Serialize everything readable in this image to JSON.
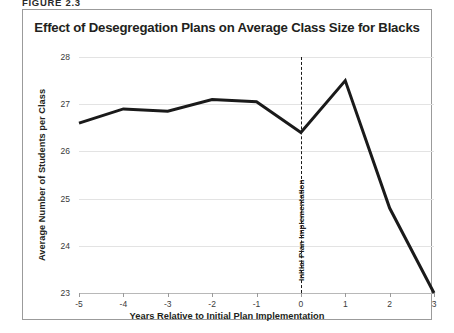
{
  "figure": {
    "label": "FIGURE 2.3"
  },
  "chart": {
    "title": "Effect of Desegregation Plans on Average Class Size for Blacks",
    "border_color": "#9b9b9b",
    "line_color": "#1a1a1a",
    "grid_color": "#e3e3e3",
    "axis_color": "#b8b8b8"
  },
  "annotation": {
    "event_label": "Initial Plan Implementation",
    "event_x": 0
  },
  "chart_data": {
    "type": "line",
    "title": "Effect of Desegregation Plans on Average Class Size for Blacks",
    "xlabel": "Years Relative to Initial Plan Implementation",
    "ylabel": "Average Number of Students per Class",
    "x": [
      -5,
      -4,
      -3,
      -2,
      -1,
      0,
      1,
      2,
      3
    ],
    "xtick_labels": [
      "-5",
      "-4",
      "-3",
      "-2",
      "-1",
      "0",
      "1",
      "2",
      "3"
    ],
    "values": [
      26.6,
      26.9,
      26.85,
      27.1,
      27.05,
      26.4,
      27.5,
      24.8,
      23.0
    ],
    "ytick_labels": [
      "28",
      "27",
      "26",
      "25",
      "24",
      "23"
    ],
    "yticks": [
      28,
      27,
      26,
      25,
      24,
      23
    ],
    "ylim": [
      23,
      28
    ],
    "xlim": [
      -5,
      3
    ],
    "grid": "horizontal",
    "legend": "none",
    "series": [
      {
        "name": "Average class size for blacks",
        "values": [
          26.6,
          26.9,
          26.85,
          27.1,
          27.05,
          26.4,
          27.5,
          24.8,
          23.0
        ]
      }
    ],
    "annotations": [
      {
        "type": "vline",
        "x": 0,
        "style": "dashed",
        "label": "Initial Plan Implementation"
      }
    ]
  }
}
